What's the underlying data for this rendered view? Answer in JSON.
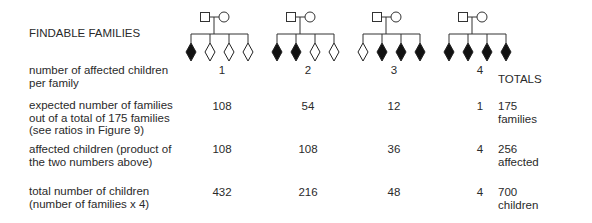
{
  "title": "FINDABLE FAMILIES",
  "totals_header": "TOTALS",
  "pedigree_legend": {
    "parents": [
      "male-square-unaffected",
      "female-circle-unaffected"
    ],
    "children_per_family": 4,
    "affected_symbol": "filled-diamond",
    "unaffected_symbol": "open-diamond"
  },
  "families": [
    {
      "affected": [
        true,
        false,
        false,
        false
      ]
    },
    {
      "affected": [
        true,
        true,
        false,
        false
      ]
    },
    {
      "affected": [
        false,
        true,
        true,
        true
      ]
    },
    {
      "affected": [
        true,
        true,
        true,
        true
      ]
    }
  ],
  "rows": [
    {
      "label_lines": [
        "number of affected children",
        "per family"
      ],
      "values": [
        "1",
        "2",
        "3",
        "4"
      ],
      "total_lines": []
    },
    {
      "label_lines": [
        "expected number of families",
        "out of a total of 175 families",
        "(see ratios in Figure 9)"
      ],
      "values": [
        "108",
        "54",
        "12",
        "1"
      ],
      "total_lines": [
        "175",
        "families"
      ]
    },
    {
      "label_lines": [
        "affected children (product of",
        "the two numbers above)"
      ],
      "values": [
        "108",
        "108",
        "36",
        "4"
      ],
      "total_lines": [
        "256",
        "affected"
      ]
    },
    {
      "label_lines": [
        "total number of children",
        "(number of families x 4)"
      ],
      "values": [
        "432",
        "216",
        "48",
        "4"
      ],
      "total_lines": [
        "700",
        "children"
      ]
    }
  ]
}
